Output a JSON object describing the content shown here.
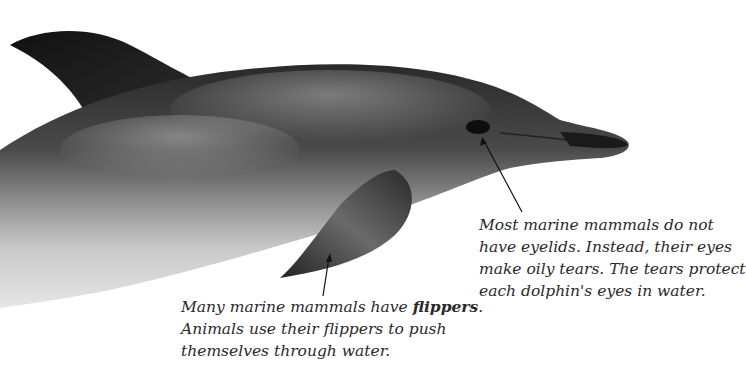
{
  "figure": {
    "subject": "dolphin",
    "captions": {
      "eyes": {
        "lines": [
          "Most marine mammals do not",
          "have eyelids. Instead, their eyes",
          "make oily tears. The tears protect",
          "each dolphin's eyes in water."
        ]
      },
      "flippers": {
        "line1_prefix": "Many marine mammals have ",
        "line1_bold": "flippers",
        "line1_suffix": ".",
        "lines": [
          "Animals use their flippers to push",
          "themselves through water."
        ]
      }
    },
    "pointers": {
      "eyes": {
        "from": [
          522,
          212
        ],
        "to": [
          482,
          137
        ]
      },
      "flippers": {
        "from": [
          323,
          296
        ],
        "to": [
          330,
          253
        ]
      }
    },
    "colors": {
      "background": "#ffffff",
      "text": "#2a2a2a",
      "dolphin_dark": "#1c1c1c",
      "dolphin_mid": "#6a6a6a",
      "dolphin_belly": "#d8d8d8"
    }
  }
}
